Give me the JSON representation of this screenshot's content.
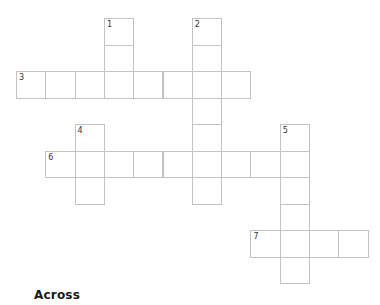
{
  "puzzle": {
    "grid": {
      "origin_x": 16,
      "origin_y": 18,
      "cell_w": 29.3,
      "cell_h": 26.5,
      "border_color": "#c2c2c2",
      "number_color": "#333333"
    },
    "entries": [
      {
        "number": "1",
        "direction": "down",
        "row": 0,
        "col": 3,
        "length": 3
      },
      {
        "number": "2",
        "direction": "down",
        "row": 0,
        "col": 6,
        "length": 7
      },
      {
        "number": "3",
        "direction": "across",
        "row": 2,
        "col": 0,
        "length": 8
      },
      {
        "number": "4",
        "direction": "down",
        "row": 4,
        "col": 2,
        "length": 3
      },
      {
        "number": "5",
        "direction": "down",
        "row": 4,
        "col": 9,
        "length": 6
      },
      {
        "number": "6",
        "direction": "across",
        "row": 5,
        "col": 1,
        "length": 9
      },
      {
        "number": "7",
        "direction": "across",
        "row": 8,
        "col": 8,
        "length": 4
      }
    ]
  },
  "clues": {
    "across_heading": "Across"
  }
}
